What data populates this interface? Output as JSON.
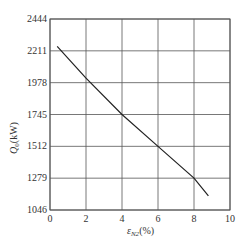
{
  "chart_data": {
    "type": "line",
    "title": "",
    "xlabel": "ε_N2(%)",
    "ylabel": "Q_0(kW)",
    "xlim": [
      0,
      10
    ],
    "ylim": [
      1046,
      2444
    ],
    "x_ticks": [
      0,
      2,
      4,
      6,
      8,
      10
    ],
    "y_ticks": [
      1046,
      1279,
      1512,
      1745,
      1978,
      2211,
      2444
    ],
    "grid": true,
    "legend": null,
    "series": [
      {
        "name": "Q0",
        "x": [
          0.4,
          2,
          4,
          6,
          8,
          8.8
        ],
        "y": [
          2244,
          2011,
          1745,
          1512,
          1279,
          1150
        ]
      }
    ]
  },
  "axis": {
    "xlabel_main": "ε",
    "xlabel_sub": "N2",
    "xlabel_unit": "(%)",
    "ylabel_main": "Q",
    "ylabel_sub": "0",
    "ylabel_unit": "(kW)"
  },
  "colors": {
    "line": "#222222",
    "grid": "#555555",
    "frame": "#555555"
  }
}
